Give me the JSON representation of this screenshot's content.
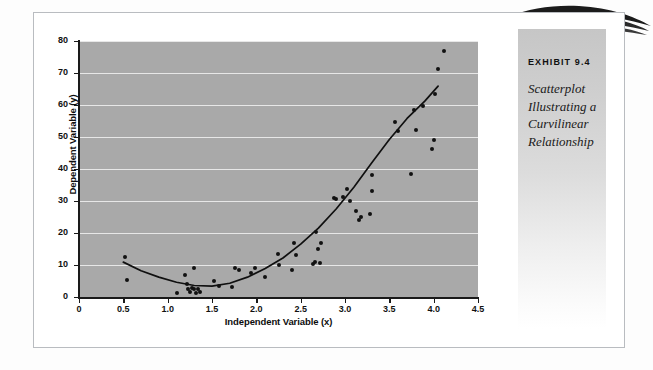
{
  "sidebar": {
    "exhibit_number": "EXHIBIT 9.4",
    "caption_lines": [
      "Scatterplot",
      "Illustrating a",
      "Curvilinear",
      "Relationship"
    ],
    "caption": "Scatterplot Illustrating a Curvilinear Relationship",
    "decoration": "swoosh-ornament"
  },
  "colors": {
    "plot_background": "#a9a9a9",
    "gridline": "#ffffff",
    "point": "#111111",
    "curve": "#101010",
    "page_border": "#b9bcc0",
    "sidebar_top": "#c6c6c6",
    "sidebar_bottom": "#ffffff"
  },
  "chart_data": {
    "type": "scatter",
    "xlabel": "Independent Variable (x)",
    "ylabel": "Dependent Variable (y)",
    "xlim": [
      0,
      4.5
    ],
    "ylim": [
      0,
      80
    ],
    "xticks": [
      0,
      0.5,
      1.0,
      1.5,
      2.0,
      2.5,
      3.0,
      3.5,
      4.0,
      4.5
    ],
    "xtick_labels": [
      "0",
      "0.5",
      "1.0",
      "1.5",
      "2.0",
      "2.5",
      "3.0",
      "3.5",
      "4.0",
      "4.5"
    ],
    "yticks": [
      0,
      10,
      20,
      30,
      40,
      50,
      60,
      70,
      80
    ],
    "ytick_labels": [
      "0",
      "10",
      "20",
      "30",
      "40",
      "50",
      "60",
      "70",
      "80"
    ],
    "grid": "horizontal",
    "legend": null,
    "points": [
      [
        0.52,
        12.6
      ],
      [
        0.54,
        5.4
      ],
      [
        1.1,
        1.2
      ],
      [
        1.22,
        4.2
      ],
      [
        1.23,
        2.6
      ],
      [
        1.25,
        1.5
      ],
      [
        1.28,
        2.7
      ],
      [
        1.3,
        2.4
      ],
      [
        1.32,
        1.4
      ],
      [
        1.34,
        2.6
      ],
      [
        1.36,
        1.5
      ],
      [
        1.19,
        7.0
      ],
      [
        1.3,
        9.0
      ],
      [
        1.52,
        5.0
      ],
      [
        1.58,
        3.3
      ],
      [
        1.72,
        3.2
      ],
      [
        1.76,
        9.0
      ],
      [
        1.8,
        8.3
      ],
      [
        1.94,
        7.5
      ],
      [
        1.99,
        9.2
      ],
      [
        2.1,
        6.3
      ],
      [
        2.25,
        9.9
      ],
      [
        2.24,
        13.4
      ],
      [
        2.4,
        8.5
      ],
      [
        2.42,
        16.9
      ],
      [
        2.45,
        13.0
      ],
      [
        2.64,
        10.2
      ],
      [
        2.66,
        11.0
      ],
      [
        2.67,
        20.2
      ],
      [
        2.7,
        15.0
      ],
      [
        2.72,
        10.5
      ],
      [
        2.73,
        17.0
      ],
      [
        2.88,
        31.0
      ],
      [
        2.9,
        30.7
      ],
      [
        2.98,
        31.3
      ],
      [
        3.02,
        33.6
      ],
      [
        3.06,
        30.0
      ],
      [
        3.12,
        27.0
      ],
      [
        3.16,
        24.2
      ],
      [
        3.18,
        25.0
      ],
      [
        3.28,
        25.8
      ],
      [
        3.3,
        33.0
      ],
      [
        3.3,
        38.2
      ],
      [
        3.56,
        54.6
      ],
      [
        3.6,
        51.8
      ],
      [
        3.74,
        38.3
      ],
      [
        3.78,
        58.5
      ],
      [
        3.8,
        52.3
      ],
      [
        3.88,
        59.6
      ],
      [
        3.98,
        46.2
      ],
      [
        4.0,
        49.1
      ],
      [
        4.02,
        63.5
      ],
      [
        4.05,
        71.2
      ],
      [
        4.12,
        76.8
      ]
    ],
    "fit_curve": {
      "kind": "quadratic",
      "description": "fitted curvilinear (U-shaped) regression line",
      "points": [
        [
          0.5,
          10.9
        ],
        [
          0.7,
          8.2
        ],
        [
          0.9,
          6.2
        ],
        [
          1.1,
          4.6
        ],
        [
          1.3,
          3.6
        ],
        [
          1.5,
          3.4
        ],
        [
          1.7,
          4.3
        ],
        [
          1.9,
          6.2
        ],
        [
          2.1,
          8.9
        ],
        [
          2.3,
          12.2
        ],
        [
          2.5,
          16.5
        ],
        [
          2.7,
          21.5
        ],
        [
          2.9,
          27.5
        ],
        [
          3.1,
          34.3
        ],
        [
          3.3,
          41.9
        ],
        [
          3.5,
          49.2
        ],
        [
          3.7,
          55.8
        ],
        [
          3.9,
          61.2
        ],
        [
          4.05,
          65.9
        ]
      ]
    }
  }
}
